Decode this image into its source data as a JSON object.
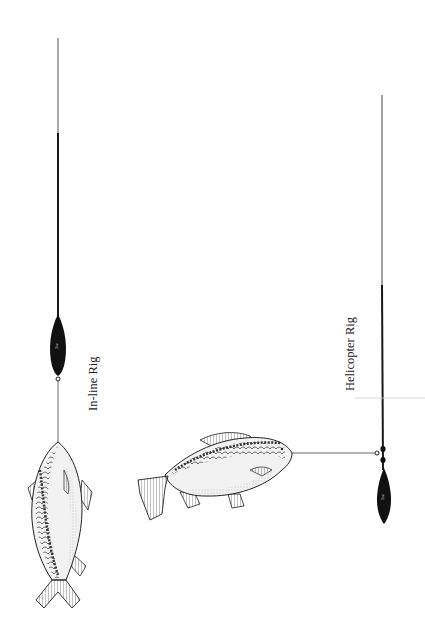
{
  "diagram": {
    "labels": {
      "inline": "In-line Rig",
      "helicopter": "Helicopter Rig"
    },
    "colors": {
      "line": "#1a1a1a",
      "lead": "#111111",
      "fish_outline": "#222222",
      "fish_shade": "#8a8a8a",
      "background": "#ffffff"
    },
    "rigs": [
      {
        "name": "In-line Rig",
        "components": [
          "main-line",
          "in-line-lead",
          "swivel",
          "hooklink",
          "carp"
        ]
      },
      {
        "name": "Helicopter Rig",
        "components": [
          "main-line",
          "beads",
          "swivel",
          "lead",
          "hooklink",
          "carp"
        ]
      }
    ]
  }
}
